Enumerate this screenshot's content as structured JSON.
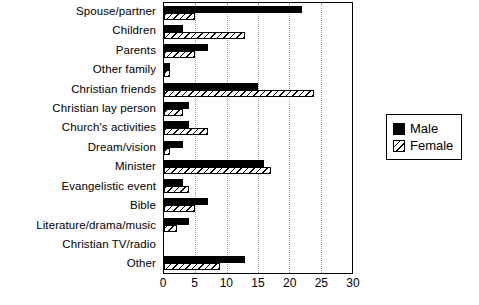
{
  "chart_data": {
    "type": "bar",
    "orientation": "horizontal",
    "title": "",
    "subtitle": "",
    "xlabel": "",
    "ylabel": "",
    "xlim": [
      0,
      30
    ],
    "xticks": [
      0,
      5,
      10,
      15,
      20,
      25,
      30
    ],
    "xtick_labels": [
      "0",
      "5",
      "10",
      "15",
      "20",
      "25",
      "30"
    ],
    "grid": "vertical-dotted",
    "legend_position": "right",
    "categories": [
      "Spouse/partner",
      "Children",
      "Parents",
      "Other family",
      "Christian friends",
      "Christian lay person",
      "Church's activities",
      "Dream/vision",
      "Minister",
      "Evangelistic event",
      "Bible",
      "Literature/drama/music",
      "Christian TV/radio",
      "Other"
    ],
    "series": [
      {
        "name": "Male",
        "color": "#000000",
        "fill": "solid",
        "values": [
          22,
          3,
          7,
          1,
          15,
          4,
          4,
          3,
          16,
          3,
          7,
          4,
          0,
          13
        ]
      },
      {
        "name": "Female",
        "color": "#000000",
        "fill": "diagonal-hatch",
        "values": [
          5,
          13,
          5,
          1,
          24,
          3,
          7,
          1,
          17,
          4,
          5,
          2,
          0,
          9
        ]
      }
    ]
  },
  "legend": {
    "entries": [
      {
        "label": "Male"
      },
      {
        "label": "Female"
      }
    ]
  }
}
